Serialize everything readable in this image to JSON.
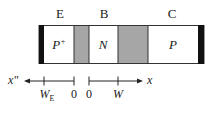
{
  "diagram": {
    "type": "PNP bipolar transistor cross-section",
    "regions": [
      {
        "terminal": "E",
        "doping": "P",
        "doping_sup": "+"
      },
      {
        "terminal": "B",
        "doping": "N",
        "doping_sup": ""
      },
      {
        "terminal": "C",
        "doping": "P",
        "doping_sup": ""
      }
    ],
    "axes": {
      "left_axis_label": "x\"",
      "right_axis_label": "x",
      "ticks": [
        {
          "main": "W",
          "sub": "E"
        },
        {
          "main": "0",
          "sub": ""
        },
        {
          "main": "0",
          "sub": ""
        },
        {
          "main": "W",
          "sub": ""
        }
      ]
    },
    "colors": {
      "contact": "#111111",
      "depletion": "#a6a6a6",
      "outline": "#333333",
      "region_fill": "#ffffff"
    }
  }
}
